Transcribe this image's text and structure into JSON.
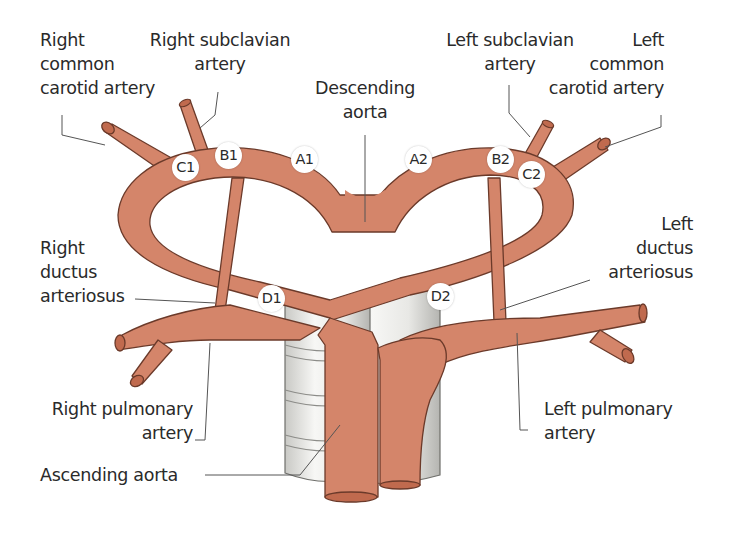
{
  "diagram": {
    "colors": {
      "artery": "#d4856a",
      "artery_outline": "#6b3a2a",
      "artery_lumen": "#c06a4e",
      "tube_fill": "#ececea",
      "tube_shade": "#b8b8b4",
      "leader_line": "#555555",
      "text": "#2a2a2a"
    },
    "labels": {
      "right_common_carotid": [
        "Right",
        "common",
        "carotid artery"
      ],
      "right_subclavian": [
        "Right subclavian",
        "artery"
      ],
      "descending_aorta": [
        "Descending",
        "aorta"
      ],
      "left_subclavian": [
        "Left subclavian",
        "artery"
      ],
      "left_common_carotid": [
        "Left",
        "common",
        "carotid artery"
      ],
      "right_ductus": [
        "Right",
        "ductus",
        "arteriosus"
      ],
      "left_ductus": [
        "Left",
        "ductus",
        "arteriosus"
      ],
      "right_pulmonary": [
        "Right pulmonary",
        "artery"
      ],
      "left_pulmonary": [
        "Left pulmonary",
        "artery"
      ],
      "ascending_aorta": [
        "Ascending aorta"
      ]
    },
    "segment_markers": {
      "A1": "A1",
      "A2": "A2",
      "B1": "B1",
      "B2": "B2",
      "C1": "C1",
      "C2": "C2",
      "D1": "D1",
      "D2": "D2"
    }
  }
}
